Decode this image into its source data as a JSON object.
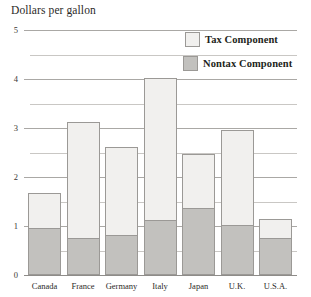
{
  "chart_data": {
    "type": "bar",
    "subtype": "stacked-bar",
    "title": "Dollars per gallon",
    "xlabel": "",
    "ylabel": "Dollars per gallon",
    "ylim": [
      0,
      5
    ],
    "yticks": [
      0,
      1,
      2,
      3,
      4,
      5
    ],
    "ytick_labels": [
      "0",
      "1",
      "2",
      "3",
      "4",
      "5"
    ],
    "minor_gridlines": [
      0.5,
      1.5,
      2.5,
      3.5,
      4.5
    ],
    "grid": true,
    "legend_position": "top-right",
    "categories": [
      "Canada",
      "France",
      "Germany",
      "Italy",
      "Japan",
      "U.K.",
      "U.S.A."
    ],
    "series": [
      {
        "name": "Nontax Component",
        "color": "#c2c1be",
        "values": [
          0.96,
          0.76,
          0.82,
          1.12,
          1.37,
          1.02,
          0.76
        ]
      },
      {
        "name": "Tax Component",
        "color": "#f1f0ee",
        "values": [
          0.72,
          2.36,
          1.79,
          2.9,
          1.1,
          1.94,
          0.38
        ]
      }
    ],
    "totals": [
      1.68,
      3.12,
      2.61,
      4.02,
      2.47,
      2.96,
      1.14
    ]
  },
  "legend": {
    "entries": [
      {
        "label": "Tax Component",
        "swatch": "legend-swatch-tax"
      },
      {
        "label": "Nontax Component",
        "swatch": "legend-swatch-nontax"
      }
    ]
  },
  "colors": {
    "tax": "#f1f0ee",
    "nontax": "#c2c1be",
    "bar_border": "#9b9996",
    "gridline": "#b9b7b4",
    "axis": "#8e8c89",
    "text": "#231f20",
    "background": "#ffffff"
  }
}
